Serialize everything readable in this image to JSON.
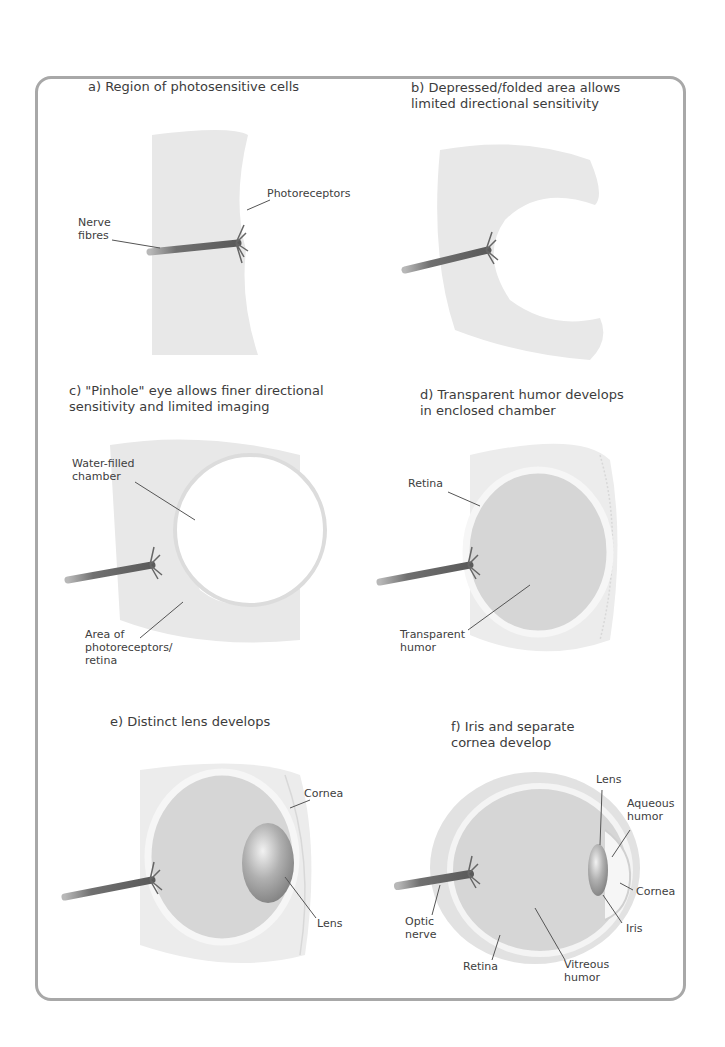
{
  "panels": {
    "a": {
      "title": "a) Region of photosensitive cells",
      "labels": {
        "photoreceptors": "Photoreceptors",
        "nerve_fibres": "Nerve\nfibres"
      }
    },
    "b": {
      "title": "b) Depressed/folded area allows\nlimited directional sensitivity"
    },
    "c": {
      "title": "c) \"Pinhole\" eye allows finer directional\nsensitivity and limited imaging",
      "labels": {
        "chamber": "Water-filled\nchamber",
        "area": "Area of\nphotoreceptors/\nretina"
      }
    },
    "d": {
      "title": "d) Transparent humor develops\nin enclosed chamber",
      "labels": {
        "retina": "Retina",
        "humor": "Transparent\nhumor"
      }
    },
    "e": {
      "title": "e) Distinct lens develops",
      "labels": {
        "cornea": "Cornea",
        "lens": "Lens"
      }
    },
    "f": {
      "title": "f) Iris and separate\ncornea develop",
      "labels": {
        "lens": "Lens",
        "aqueous": "Aqueous\nhumor",
        "cornea": "Cornea",
        "optic": "Optic\nnerve",
        "iris": "Iris",
        "retina": "Retina",
        "vitreous": "Vitreous\nhumor"
      }
    }
  },
  "colors": {
    "border": "#a8a8a8",
    "tissue": "#e6e6e6",
    "humor": "#d4d4d4",
    "nerve": "#6e6e6e",
    "lens": "#9a9a9a"
  }
}
